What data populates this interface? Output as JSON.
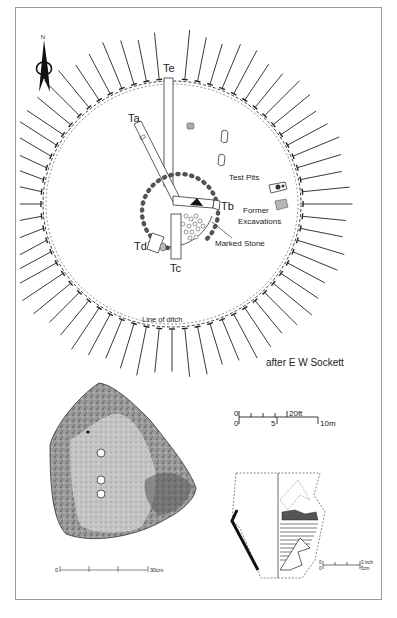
{
  "figure": {
    "credit": "after E W Sockett",
    "north_arrow": {
      "label": "N"
    }
  },
  "plan": {
    "trench_labels": [
      "Ta",
      "Tb",
      "Tc",
      "Td",
      "Te"
    ],
    "labels": {
      "ta": "Ta",
      "tb": "Tb",
      "tc": "Tc",
      "td": "Td",
      "te": "Te",
      "test_pits": "Test Pits",
      "former_excavations_1": "Former",
      "former_excavations_2": "Excavations",
      "marked_stone": "Marked Stone",
      "line_of_ditch": "Line of ditch"
    },
    "scale_bar": {
      "top_zero": "0",
      "top_end": "20ft",
      "bottom_zero": "0",
      "bottom_mid": "5",
      "bottom_end": "10m"
    }
  },
  "stone_drawing": {
    "scale_bar": {
      "zero": "0",
      "end": "30cm"
    },
    "cup_marks": 3
  },
  "pottery_drawing": {
    "scale_bar": {
      "top_zero": "0",
      "top_end": "3 inch",
      "bottom_zero": "0",
      "bottom_end": "5cm"
    }
  },
  "colors": {
    "ink": "#1a1a1a",
    "frame": "#9a9a9a",
    "stone_fill": "#8a8a8a",
    "excavation_fill": "#b5b5b5"
  }
}
